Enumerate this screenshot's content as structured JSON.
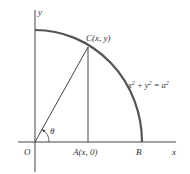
{
  "diagram": {
    "type": "geometry",
    "colors": {
      "axes": "#444444",
      "arc": "#555555",
      "lines": "#444444",
      "text": "#333333"
    },
    "labels": {
      "y_axis": "y",
      "x_axis": "x",
      "origin": "O",
      "point_c": "C(x, y)",
      "point_a": "A(x, 0)",
      "point_b": "B",
      "angle": "θ",
      "equation_base": "x",
      "equation_exp1": "2",
      "equation_mid": " + y",
      "equation_exp2": "2",
      "equation_eq": " = a",
      "equation_exp3": "2"
    },
    "points": {
      "O": [
        35,
        142
      ],
      "C": [
        88,
        47
      ],
      "A": [
        88,
        142
      ],
      "B": [
        142,
        142
      ]
    }
  }
}
